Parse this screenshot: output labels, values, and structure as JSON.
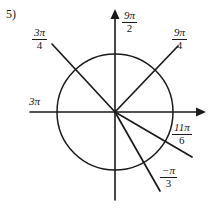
{
  "problem": {
    "number_label": "5)"
  },
  "figure": {
    "type": "unit-circle-angle-diagram",
    "origin": {
      "x": 115,
      "y": 112
    },
    "circle_radius": 58,
    "axes": {
      "x_axis": {
        "from_x": 30,
        "to_x": 205,
        "y": 112,
        "arrow": "right"
      },
      "y_axis": {
        "x": 115,
        "from_y": 10,
        "to_y": 200,
        "arrow": "up"
      }
    },
    "rays": [
      {
        "name": "ray-3pi-over-4",
        "angle_deg": 135,
        "end_x": 52,
        "end_y": 44
      },
      {
        "name": "ray-9pi-over-4",
        "angle_deg": 45,
        "end_x": 178,
        "end_y": 46
      },
      {
        "name": "ray-11pi-over-6",
        "angle_deg": -30,
        "end_x": 192,
        "end_y": 157
      },
      {
        "name": "ray-neg-pi-over-3",
        "angle_deg": -62,
        "end_x": 160,
        "end_y": 190
      }
    ]
  },
  "labels": {
    "top_axis": {
      "numerator": "9π",
      "denominator": "2",
      "is_fraction": true
    },
    "upper_right": {
      "numerator": "9π",
      "denominator": "4",
      "is_fraction": true
    },
    "upper_left": {
      "numerator": "3π",
      "denominator": "4",
      "is_fraction": true
    },
    "left_axis": {
      "text": "3π",
      "is_fraction": false
    },
    "lower_right": {
      "numerator": "11π",
      "denominator": "6",
      "is_fraction": true
    },
    "bottom_right": {
      "numerator": "−π",
      "denominator": "3",
      "is_fraction": true
    }
  },
  "colors": {
    "ink": "#1a1a1a",
    "background": "#ffffff"
  }
}
